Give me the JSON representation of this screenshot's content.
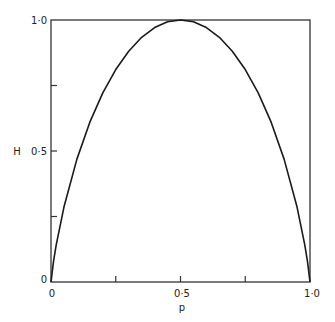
{
  "chart_data": {
    "type": "line",
    "title": "",
    "xlabel": "p",
    "ylabel": "H",
    "xlim": [
      0,
      1.0
    ],
    "ylim": [
      0,
      1.0
    ],
    "grid": false,
    "legend": null,
    "x_ticks": [
      0,
      0.25,
      0.5,
      0.75,
      1.0
    ],
    "x_tick_labels": [
      "0",
      "",
      "0·5",
      "",
      "1·0"
    ],
    "y_ticks": [
      0,
      0.25,
      0.5,
      0.75,
      1.0
    ],
    "y_tick_labels": [
      "0",
      "",
      "0·5",
      "",
      "1·0"
    ],
    "series": [
      {
        "name": "H(p)",
        "x": [
          0,
          0.01,
          0.02,
          0.05,
          0.1,
          0.15,
          0.2,
          0.25,
          0.3,
          0.35,
          0.4,
          0.45,
          0.5,
          0.55,
          0.6,
          0.65,
          0.7,
          0.75,
          0.8,
          0.85,
          0.9,
          0.95,
          0.98,
          0.99,
          1.0
        ],
        "values": [
          0,
          0.081,
          0.141,
          0.286,
          0.469,
          0.61,
          0.722,
          0.811,
          0.881,
          0.934,
          0.971,
          0.993,
          1.0,
          0.993,
          0.971,
          0.934,
          0.881,
          0.811,
          0.722,
          0.61,
          0.469,
          0.286,
          0.141,
          0.081,
          0
        ]
      }
    ]
  },
  "labels": {
    "x_axis": "p",
    "y_axis": "H",
    "x_tick_0": "0",
    "x_tick_mid": "0·5",
    "x_tick_1": "1·0",
    "y_tick_0": "0",
    "y_tick_mid": "0·5",
    "y_tick_1": "1·0"
  },
  "colors": {
    "line": "#1a1a1a",
    "frame": "#333333",
    "background": "#ffffff"
  }
}
